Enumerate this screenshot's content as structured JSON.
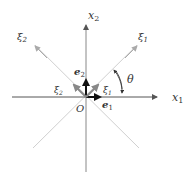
{
  "diagram": {
    "axes": {
      "x1": {
        "label": "x",
        "sub": "1"
      },
      "x2": {
        "label": "x",
        "sub": "2"
      },
      "xi1": {
        "label": "ξ",
        "sub": "1"
      },
      "xi2": {
        "label": "ξ",
        "sub": "2"
      }
    },
    "vectors": {
      "e1": {
        "label": "e",
        "sub": "1"
      },
      "e2": {
        "label": "e",
        "sub": "2"
      },
      "xi1_vec": {
        "label": "ξ",
        "sub": "1"
      },
      "xi2_vec": {
        "label": "ξ",
        "sub": "2"
      }
    },
    "origin_label": "O",
    "angle_label": "θ",
    "colors": {
      "axis": "#555555",
      "diagonal": "#cccccc",
      "vector_dark": "#111111",
      "vector_gray": "#888888"
    }
  }
}
